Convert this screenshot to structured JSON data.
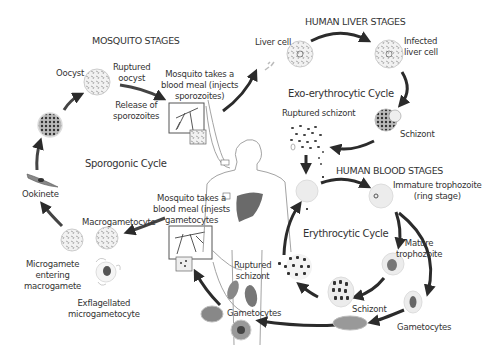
{
  "sections": {
    "mosquito": "MOSQUITO STAGES",
    "liver": "HUMAN LIVER STAGES",
    "blood": "HUMAN BLOOD STAGES"
  },
  "cycles": {
    "sporogonic": "Sporogonic Cycle",
    "exo_erythrocytic": "Exo-erythrocytic Cycle",
    "erythrocytic": "Erythrocytic Cycle"
  },
  "labels": {
    "oocyst": "Oocyst",
    "ruptured_oocyst": [
      "Ruptured",
      "oocyst"
    ],
    "release_sporozoites": [
      "Release of",
      "sporozoites"
    ],
    "mosquito_meal_sporozoites": [
      "Mosquito takes a",
      "blood meal (injects",
      "sporozoites)"
    ],
    "liver_cell": "Liver cell",
    "infected_liver_cell": [
      "Infected",
      "liver cell"
    ],
    "schizont_liver": "Schizont",
    "ruptured_schizont_liver": "Ruptured schizont",
    "immature_trophozoite": [
      "Immature trophozoite",
      "(ring stage)"
    ],
    "mature_trophozoite": [
      "Mature",
      "trophozoite"
    ],
    "schizont_blood": "Schizont",
    "gametocytes_right": "Gametocytes",
    "ruptured_schizont_blood": [
      "Ruptured",
      "schizont"
    ],
    "gametocytes_left": "Gametocytes",
    "mosquito_meal_gametocytes": [
      "Mosquito takes a",
      "blood meal (injests",
      "gametocytes"
    ],
    "macrogametocyte": "Macrogametocyte",
    "exflagellated": [
      "Exflagellated",
      "microgametocyte"
    ],
    "microgamete_entering": [
      "Microgamete",
      "entering",
      "macrogamete"
    ],
    "ookinete": "Ookinete"
  },
  "colors": {
    "arrow": "#2b2b2b",
    "text": "#333333",
    "cell_fill": "#e9e9e9",
    "dark_cell": "#555555",
    "liver_organ": "#6a6a6a"
  }
}
